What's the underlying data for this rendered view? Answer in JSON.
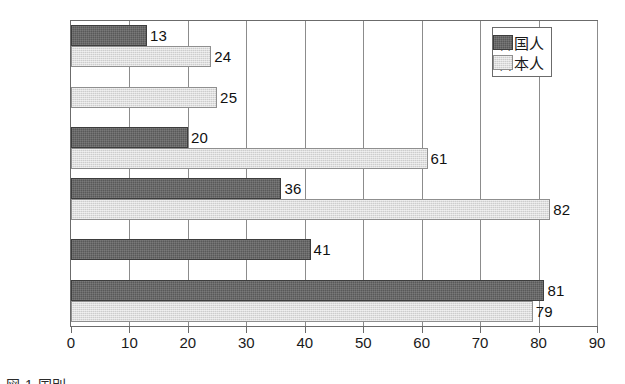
{
  "chart_data": {
    "type": "bar",
    "orientation": "horizontal",
    "title": "",
    "xlabel": "",
    "ylabel": "",
    "xlim": [
      0,
      90
    ],
    "xticks": [
      0,
      10,
      20,
      30,
      40,
      50,
      60,
      70,
      80,
      90
    ],
    "grid": true,
    "legend_position": "top-right",
    "categories": [
      "米国",
      "韓国",
      "ロシア",
      "中国",
      "日本",
      "北朝鮮"
    ],
    "series": [
      {
        "name": "韓国人",
        "color": "#595959",
        "values": [
          13,
          null,
          20,
          36,
          41,
          81
        ]
      },
      {
        "name": "日本人",
        "color": "#cdcdcd",
        "values": [
          24,
          25,
          61,
          82,
          null,
          79
        ]
      }
    ]
  },
  "legend": {
    "items": [
      {
        "label": "韓国人",
        "swatch": "dark"
      },
      {
        "label": "日本人",
        "swatch": "light"
      }
    ]
  },
  "axis": {
    "tick_labels": [
      "0",
      "10",
      "20",
      "30",
      "40",
      "50",
      "60",
      "70",
      "80",
      "90"
    ]
  },
  "caption": {
    "text": "図 1  国別"
  }
}
